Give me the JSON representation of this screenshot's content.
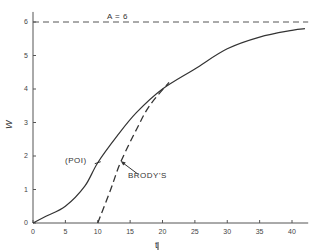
{
  "chart_data": {
    "type": "line",
    "title": "",
    "xlabel": "t",
    "ylabel": "W",
    "xlim": [
      0,
      42
    ],
    "ylim": [
      0,
      6.3
    ],
    "grid": false,
    "x_ticks": [
      "0",
      "5",
      "10",
      "15",
      "20",
      "25",
      "30",
      "35",
      "40"
    ],
    "y_ticks": [
      "0",
      "1",
      "2",
      "3",
      "4",
      "5",
      "6"
    ],
    "asymptote": {
      "label": "A = 6",
      "value": 6,
      "style": "dashed"
    },
    "series": [
      {
        "name": "(POI)",
        "style": "solid",
        "x": [
          0,
          2,
          5,
          8,
          10,
          13,
          16,
          20,
          25,
          30,
          35,
          40,
          42
        ],
        "y": [
          0,
          0.2,
          0.5,
          1.1,
          1.8,
          2.6,
          3.3,
          4.0,
          4.6,
          5.2,
          5.55,
          5.75,
          5.8
        ]
      },
      {
        "name": "BRODY'S",
        "style": "dashed",
        "x": [
          10,
          12,
          13.5,
          16,
          18,
          21
        ],
        "y": [
          0,
          1.0,
          1.8,
          2.8,
          3.5,
          4.2
        ]
      }
    ],
    "annotations": [
      {
        "text": "(POI)",
        "x": 10,
        "y": 1.8
      },
      {
        "text": "BRODY'S",
        "x": 13.5,
        "y": 1.8
      },
      {
        "text": "A = 6",
        "x": 13,
        "y": 6
      }
    ]
  },
  "labels": {
    "asymptote": "A = 6",
    "poi": "(POI)",
    "brody": "BRODY'S",
    "xlabel": "t",
    "ylabel": "W"
  }
}
